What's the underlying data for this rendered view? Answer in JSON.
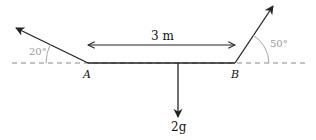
{
  "diagram": {
    "points": {
      "A": "A",
      "B": "B"
    },
    "length_label": "3 m",
    "weight_label": "2g",
    "angle_left": "20°",
    "angle_right": "50°",
    "colors": {
      "line": "#222222",
      "dashed": "#888888",
      "angle": "#9a9a9a"
    }
  }
}
